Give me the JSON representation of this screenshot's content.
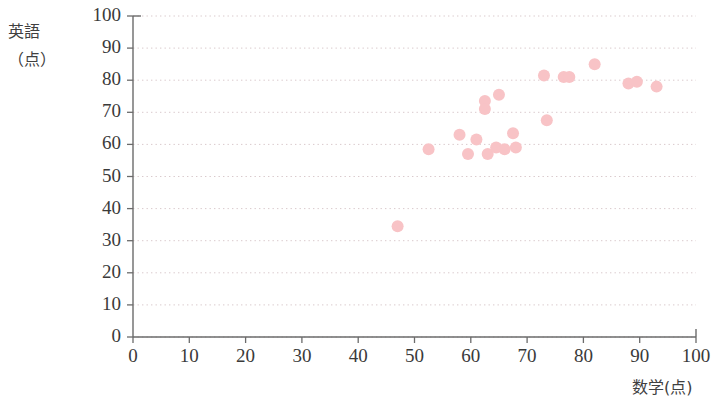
{
  "chart_data": {
    "type": "scatter",
    "title": "",
    "xlabel": "数学(点)",
    "ylabel_line1": "英語",
    "ylabel_line2": "（点）",
    "xlim": [
      0,
      100
    ],
    "ylim": [
      0,
      100
    ],
    "xticks": [
      0,
      10,
      20,
      30,
      40,
      50,
      60,
      70,
      80,
      90,
      100
    ],
    "yticks": [
      0,
      10,
      20,
      30,
      40,
      50,
      60,
      70,
      80,
      90,
      100
    ],
    "grid": "horizontal-dotted",
    "legend": "none",
    "marker_color": "#f8c3c6",
    "marker_radius": 6,
    "points": [
      {
        "x": 47,
        "y": 34.5
      },
      {
        "x": 52.5,
        "y": 58.5
      },
      {
        "x": 58,
        "y": 63
      },
      {
        "x": 59.5,
        "y": 57
      },
      {
        "x": 61,
        "y": 61.5
      },
      {
        "x": 62.5,
        "y": 73.5
      },
      {
        "x": 62.5,
        "y": 71
      },
      {
        "x": 63,
        "y": 57
      },
      {
        "x": 64.5,
        "y": 59
      },
      {
        "x": 65,
        "y": 75.5
      },
      {
        "x": 66,
        "y": 58.5
      },
      {
        "x": 67.5,
        "y": 63.5
      },
      {
        "x": 68,
        "y": 59
      },
      {
        "x": 73,
        "y": 81.5
      },
      {
        "x": 73.5,
        "y": 67.5
      },
      {
        "x": 76.5,
        "y": 81
      },
      {
        "x": 77.5,
        "y": 81
      },
      {
        "x": 82,
        "y": 85
      },
      {
        "x": 88,
        "y": 79
      },
      {
        "x": 89.5,
        "y": 79.5
      },
      {
        "x": 93,
        "y": 78
      }
    ]
  }
}
